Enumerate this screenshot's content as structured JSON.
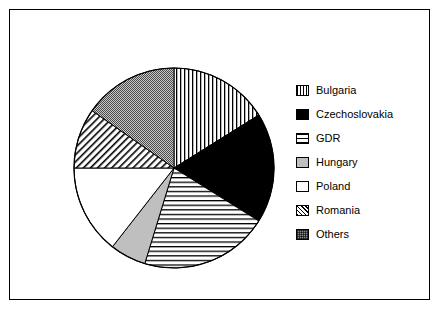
{
  "chart_data": {
    "type": "pie",
    "title": "",
    "subtitle": "",
    "xlabel": "",
    "ylabel": "",
    "grid": false,
    "legend_position": "right",
    "center": [
      163,
      157
    ],
    "radius": 100,
    "start_angle_deg": 0,
    "direction": "clockwise",
    "categories": [
      "Bulgaria",
      "Czechoslovakia",
      "GDR",
      "Hungary",
      "Poland",
      "Romania",
      "Others"
    ],
    "values": [
      16.1,
      17.8,
      20.8,
      5.8,
      14.5,
      9.7,
      15.3
    ],
    "angles_deg": [
      58,
      64,
      75,
      21,
      52,
      35,
      55
    ],
    "boundaries_deg": [
      0,
      58,
      122,
      197,
      218,
      270,
      305,
      360
    ],
    "fills": [
      "vertical-lines",
      "solid-black",
      "horizontal-lines",
      "light-gray",
      "white",
      "diagonal-hatch",
      "dark-checker"
    ]
  },
  "legend": {
    "items": [
      {
        "label": "Bulgaria",
        "swatch": "vertical-lines",
        "color": "#000000"
      },
      {
        "label": "Czechoslovakia",
        "swatch": "solid-black",
        "color": "#000000"
      },
      {
        "label": "GDR",
        "swatch": "horizontal-lines",
        "color": "#000000"
      },
      {
        "label": "Hungary",
        "swatch": "light-gray",
        "color": "#bfbfbf"
      },
      {
        "label": "Poland",
        "swatch": "white",
        "color": "#ffffff"
      },
      {
        "label": "Romania",
        "swatch": "diagonal-hatch",
        "color": "#000000"
      },
      {
        "label": "Others",
        "swatch": "dark-checker",
        "color": "#8a8a8a"
      }
    ]
  },
  "figure": {
    "background": "#ffffff",
    "border_color": "#000000"
  }
}
